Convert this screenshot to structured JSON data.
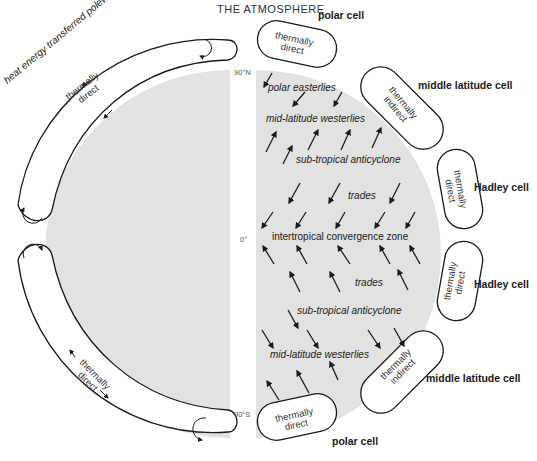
{
  "title": "THE ATMOSPHERE",
  "latitude_labels": {
    "north": "90°N",
    "equator": "0°",
    "south": "90°S"
  },
  "left_hemisphere": {
    "top_arrow_label": "heat energy transferred polewards",
    "top_cell_label": "thermally direct",
    "bottom_cell_label": "thermally direct"
  },
  "cells": [
    {
      "name": "polar cell",
      "type": "thermally direct",
      "hemisphere": "north"
    },
    {
      "name": "middle latitude cell",
      "type": "thermally indirect",
      "hemisphere": "north"
    },
    {
      "name": "Hadley cell",
      "type": "thermally direct",
      "hemisphere": "north"
    },
    {
      "name": "Hadley cell",
      "type": "thermally direct",
      "hemisphere": "south"
    },
    {
      "name": "middle latitude cell",
      "type": "thermally indirect",
      "hemisphere": "south"
    },
    {
      "name": "polar cell",
      "type": "thermally direct",
      "hemisphere": "south"
    }
  ],
  "wind_zones": [
    {
      "label": "polar easterlies"
    },
    {
      "label": "mid-latitude westerlies"
    },
    {
      "label": "sub-tropical anticyclone"
    },
    {
      "label": "trades"
    },
    {
      "label": "intertropical convergence zone"
    },
    {
      "label": "trades"
    },
    {
      "label": "sub-tropical anticyclone"
    },
    {
      "label": "mid-latitude westerlies"
    }
  ],
  "colors": {
    "globe_fill": "#e2e2e2",
    "line": "#1a1a1a",
    "background": "#ffffff"
  }
}
